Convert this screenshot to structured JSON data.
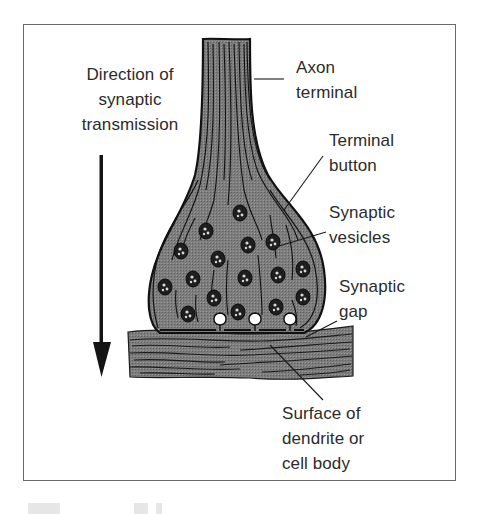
{
  "figure": {
    "type": "labeled-diagram",
    "direction_label": {
      "lines": [
        "Direction of",
        "synaptic",
        "transmission"
      ]
    },
    "labels": {
      "axon_terminal": {
        "lines": [
          "Axon",
          "terminal"
        ]
      },
      "terminal_button": {
        "lines": [
          "Terminal",
          "button"
        ]
      },
      "synaptic_vesicles": {
        "lines": [
          "Synaptic",
          "vesicles"
        ]
      },
      "synaptic_gap": {
        "lines": [
          "Synaptic",
          "gap"
        ]
      },
      "dendrite_surface": {
        "lines": [
          "Surface of",
          "dendrite or",
          "cell body"
        ]
      }
    },
    "colors": {
      "frame": "#6a6a6a",
      "text": "#2b2b2b",
      "tissue_fill": "#7b7b7b",
      "outline": "#141414",
      "vesicle_fill": "#1e1e1e"
    },
    "caption": "(cut off)"
  }
}
